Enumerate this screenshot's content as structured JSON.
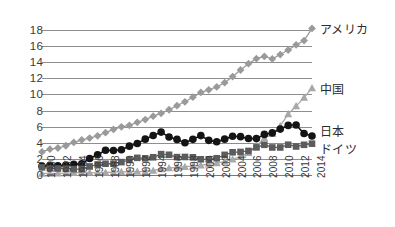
{
  "chart_data": {
    "type": "line",
    "title": "",
    "subtitle": "",
    "xlabel": "",
    "ylabel": "",
    "xlim": [
      1980,
      2014
    ],
    "ylim": [
      0,
      19
    ],
    "grid": true,
    "legend_position": "right-inline",
    "y_ticks": [
      0,
      2,
      4,
      6,
      8,
      10,
      12,
      14,
      16,
      18
    ],
    "x_ticks": [
      "1980",
      "1982",
      "1984",
      "1986",
      "1988",
      "1990",
      "1992",
      "1994",
      "1996",
      "1998",
      "2000",
      "2002",
      "2004",
      "2006",
      "2008",
      "2010",
      "2012",
      "2014"
    ],
    "x": [
      1980,
      1981,
      1982,
      1983,
      1984,
      1985,
      1986,
      1987,
      1988,
      1989,
      1990,
      1991,
      1992,
      1993,
      1994,
      1995,
      1996,
      1997,
      1998,
      1999,
      2000,
      2001,
      2002,
      2003,
      2004,
      2005,
      2006,
      2007,
      2008,
      2009,
      2010,
      2011,
      2012,
      2013,
      2014
    ],
    "series": [
      {
        "name": "アメリカ",
        "marker": "diamond",
        "color": "#9a9a9a",
        "values": [
          2.86,
          3.21,
          3.35,
          3.63,
          4.04,
          4.35,
          4.59,
          4.87,
          5.25,
          5.66,
          5.98,
          6.17,
          6.54,
          6.88,
          7.31,
          7.66,
          8.1,
          8.61,
          9.09,
          9.66,
          10.25,
          10.58,
          10.94,
          11.46,
          12.22,
          13.04,
          13.82,
          14.45,
          14.72,
          14.42,
          14.96,
          15.52,
          16.16,
          16.69,
          18.2
        ]
      },
      {
        "name": "中国",
        "marker": "triangle",
        "color": "#a8a8a8",
        "values": [
          0.19,
          0.19,
          0.2,
          0.23,
          0.26,
          0.31,
          0.3,
          0.27,
          0.31,
          0.35,
          0.4,
          0.38,
          0.42,
          0.44,
          0.56,
          0.73,
          0.86,
          0.96,
          1.03,
          1.09,
          1.21,
          1.34,
          1.47,
          1.66,
          1.96,
          2.29,
          2.75,
          3.55,
          4.59,
          5.11,
          6.1,
          7.57,
          8.56,
          9.61,
          10.8
        ]
      },
      {
        "name": "日本",
        "marker": "circle",
        "color": "#141414",
        "values": [
          1.1,
          1.2,
          1.13,
          1.24,
          1.32,
          1.4,
          2.05,
          2.51,
          3.07,
          3.05,
          3.13,
          3.58,
          3.91,
          4.45,
          4.91,
          5.33,
          4.71,
          4.42,
          4.0,
          4.43,
          4.89,
          4.3,
          4.12,
          4.45,
          4.82,
          4.76,
          4.53,
          4.52,
          5.04,
          5.23,
          5.7,
          6.16,
          6.2,
          5.15,
          4.85
        ]
      },
      {
        "name": "ドイツ",
        "marker": "square",
        "color": "#5c5c5c",
        "values": [
          0.95,
          0.83,
          0.8,
          0.78,
          0.73,
          0.73,
          1.06,
          1.3,
          1.4,
          1.4,
          1.6,
          1.87,
          2.13,
          2.07,
          2.2,
          2.59,
          2.51,
          2.22,
          2.24,
          2.2,
          1.95,
          1.95,
          2.08,
          2.5,
          2.82,
          2.86,
          2.99,
          3.43,
          3.75,
          3.42,
          3.42,
          3.76,
          3.54,
          3.75,
          3.89
        ]
      }
    ],
    "series_labels": [
      {
        "name": "アメリカ",
        "value_at_end": 18.2
      },
      {
        "name": "中国",
        "value_at_end": 10.8
      },
      {
        "name": "日本",
        "value_at_end": 4.85
      },
      {
        "name": "ドイツ",
        "value_at_end": 3.89
      }
    ]
  }
}
